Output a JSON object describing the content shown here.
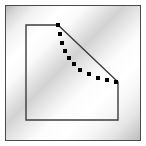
{
  "canvas": {
    "width": 146,
    "height": 146,
    "background_color": "#ffffff",
    "label": "Polygon selection preview"
  },
  "frame": {
    "name": "outer-frame",
    "x": 5,
    "y": 5,
    "width": 136,
    "height": 136,
    "border_color": "#4a4a4a",
    "border_width": 1.5,
    "fill_style": "diagonal-brushed-gradient",
    "fill_colors": [
      "#b9b9b9",
      "#ffffff",
      "#d2d2d2",
      "#ffffff",
      "#bdbdbd"
    ],
    "gradient_angle_deg": 135
  },
  "shape": {
    "name": "polygon-outline",
    "stroke_color": "#3c3c3c",
    "stroke_width": 1.4,
    "fill": "none",
    "closed": true,
    "points": [
      {
        "x": 26,
        "y": 25
      },
      {
        "x": 58,
        "y": 25
      },
      {
        "x": 118,
        "y": 82
      },
      {
        "x": 118,
        "y": 120
      },
      {
        "x": 26,
        "y": 120
      }
    ]
  },
  "handles": {
    "name": "vertex-handles",
    "color": "#000000",
    "size": 4,
    "shape": "square",
    "count": 12,
    "points": [
      {
        "x": 58,
        "y": 25
      },
      {
        "x": 60,
        "y": 34
      },
      {
        "x": 62,
        "y": 43
      },
      {
        "x": 65,
        "y": 51
      },
      {
        "x": 69,
        "y": 58
      },
      {
        "x": 74,
        "y": 64
      },
      {
        "x": 80,
        "y": 70
      },
      {
        "x": 89,
        "y": 74
      },
      {
        "x": 98,
        "y": 78
      },
      {
        "x": 107,
        "y": 80
      },
      {
        "x": 116,
        "y": 82
      }
    ]
  }
}
